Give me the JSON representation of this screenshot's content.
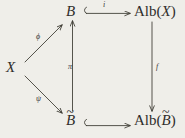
{
  "figure": {
    "kind": "commutative-diagram",
    "background_color": "#efeee9",
    "ink_color": "#2f2d2b"
  },
  "nodes": {
    "x": {
      "label": "X"
    },
    "b": {
      "label": "B"
    },
    "b_tilde": {
      "base": "B",
      "accent": "~"
    },
    "alb_x": {
      "prefix": "Alb(",
      "arg": "X",
      "suffix": ")"
    },
    "alb_b_tilde": {
      "prefix": "Alb(",
      "arg_base": "B",
      "arg_accent": "~",
      "suffix": ")"
    }
  },
  "arrows": {
    "phi": {
      "label": "ϕ",
      "from": "X",
      "to": "B",
      "style": "solid",
      "head": "plain"
    },
    "psi": {
      "label": "ψ",
      "from": "X",
      "to": "B̃",
      "style": "solid",
      "head": "plain"
    },
    "pi": {
      "label": "π",
      "from": "B̃",
      "to": "B",
      "style": "solid",
      "head": "plain",
      "direction": "up"
    },
    "i": {
      "label": "i",
      "from": "B",
      "to": "Alb(X)",
      "style": "solid",
      "head": "hook",
      "direction": "right"
    },
    "f": {
      "label": "f",
      "from": "Alb(X)",
      "to": "Alb(B̃)",
      "style": "solid",
      "head": "plain",
      "direction": "down"
    },
    "bottom_inclusion": {
      "label": "",
      "from": "B̃",
      "to": "Alb(B̃)",
      "style": "solid",
      "head": "hook",
      "direction": "right"
    }
  }
}
